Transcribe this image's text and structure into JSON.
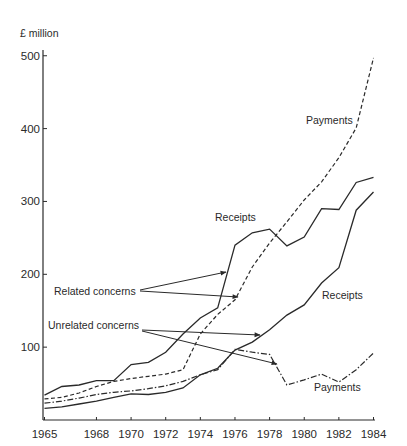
{
  "chart_data": {
    "type": "line",
    "title": "",
    "ylabel": "£ million",
    "xlabel": "",
    "xlim": [
      1965,
      1984
    ],
    "ylim": [
      0,
      520
    ],
    "grid": false,
    "x": [
      1965,
      1966,
      1967,
      1968,
      1969,
      1970,
      1971,
      1972,
      1973,
      1974,
      1975,
      1976,
      1977,
      1978,
      1979,
      1980,
      1981,
      1982,
      1983,
      1984
    ],
    "x_tick_labels": [
      "1965",
      "1968",
      "1970",
      "1972",
      "1974",
      "1976",
      "1978",
      "1980",
      "1982",
      "1984"
    ],
    "x_ticks": [
      1965,
      1968,
      1970,
      1972,
      1974,
      1976,
      1978,
      1980,
      1982,
      1984
    ],
    "y_ticks": [
      100,
      200,
      300,
      400,
      500
    ],
    "y_tick_labels": [
      "100",
      "200",
      "300",
      "400",
      "500"
    ],
    "series": [
      {
        "name": "Related concerns – Receipts",
        "group": "Related concerns",
        "kind": "Receipts",
        "style": "solid",
        "values": [
          34,
          46,
          48,
          54,
          54,
          76,
          79,
          93,
          118,
          140,
          154,
          240,
          257,
          262,
          239,
          251,
          290,
          289,
          326,
          333
        ]
      },
      {
        "name": "Related concerns – Payments",
        "group": "Related concerns",
        "kind": "Payments",
        "style": "dashed",
        "values": [
          29,
          31,
          37,
          46,
          53,
          57,
          60,
          63,
          69,
          118,
          145,
          165,
          210,
          243,
          272,
          302,
          327,
          360,
          401,
          497
        ]
      },
      {
        "name": "Unrelated concerns – Receipts",
        "group": "Unrelated concerns",
        "kind": "Receipts",
        "style": "solid",
        "values": [
          16,
          18,
          22,
          26,
          31,
          36,
          35,
          38,
          44,
          62,
          71,
          96,
          107,
          124,
          144,
          158,
          188,
          209,
          288,
          313
        ]
      },
      {
        "name": "Unrelated concerns – Payments",
        "group": "Unrelated concerns",
        "kind": "Payments",
        "style": "dashdot",
        "values": [
          23,
          26,
          30,
          35,
          38,
          40,
          43,
          47,
          53,
          62,
          69,
          97,
          93,
          90,
          48,
          55,
          63,
          52,
          69,
          92
        ]
      }
    ],
    "annotations": [
      {
        "text": "Receipts",
        "x": 215,
        "y": 218
      },
      {
        "text": "Payments",
        "x": 306,
        "y": 124
      },
      {
        "text": "Receipts",
        "x": 322,
        "y": 299
      },
      {
        "text": "Payments",
        "x": 314,
        "y": 391
      },
      {
        "text": "Related concerns",
        "x": 54,
        "y": 294
      },
      {
        "text": "Unrelated concerns",
        "x": 48,
        "y": 328
      }
    ],
    "legend": "none (inline annotations with arrows)"
  },
  "labels": {
    "unit": "£ million",
    "related_receipts": "Receipts",
    "related_payments": "Payments",
    "unrelated_receipts": "Receipts",
    "unrelated_payments": "Payments",
    "related_group": "Related concerns",
    "unrelated_group": "Unrelated concerns"
  },
  "colors": {
    "line": "#2a2a2a",
    "axis": "#2a2a2a",
    "background": "#ffffff"
  }
}
